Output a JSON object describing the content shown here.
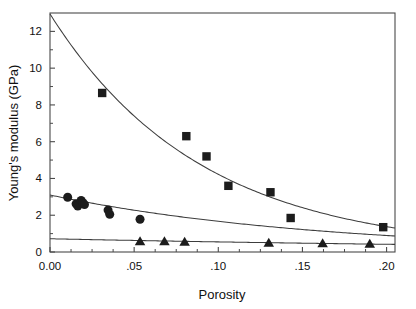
{
  "chart_data": {
    "type": "scatter",
    "title": "",
    "xlabel": "Porosity",
    "ylabel": "Young's modulus (GPa)",
    "xlim": [
      0.0,
      0.205
    ],
    "ylim": [
      0.0,
      13.0
    ],
    "xticks": [
      0.0,
      0.05,
      0.1,
      0.15,
      0.2
    ],
    "xticklabels": [
      "0.00",
      ".05",
      ".10",
      ".15",
      ".20"
    ],
    "yticks": [
      0,
      2,
      4,
      6,
      8,
      10,
      12
    ],
    "yticklabels": [
      "0",
      "2",
      "4",
      "6",
      "8",
      "10",
      "12"
    ],
    "minor_yticks": [
      1,
      3,
      5,
      7,
      9,
      11
    ],
    "grid": false,
    "legend": "none",
    "frame": "full-box",
    "series": [
      {
        "name": "series-squares",
        "marker": "square",
        "points": [
          {
            "x": 0.031,
            "y": 8.65
          },
          {
            "x": 0.081,
            "y": 6.3
          },
          {
            "x": 0.093,
            "y": 5.2
          },
          {
            "x": 0.106,
            "y": 3.6
          },
          {
            "x": 0.131,
            "y": 3.25
          },
          {
            "x": 0.143,
            "y": 1.85
          },
          {
            "x": 0.198,
            "y": 1.35
          }
        ],
        "fit": {
          "type": "exponential",
          "y0": 12.95,
          "decay_rate": 11.2,
          "x_start": 0.0,
          "x_end": 0.205
        }
      },
      {
        "name": "series-circles",
        "marker": "circle",
        "points": [
          {
            "x": 0.0105,
            "y": 2.98
          },
          {
            "x": 0.0155,
            "y": 2.62
          },
          {
            "x": 0.0165,
            "y": 2.5
          },
          {
            "x": 0.0185,
            "y": 2.8
          },
          {
            "x": 0.0195,
            "y": 2.68
          },
          {
            "x": 0.0205,
            "y": 2.58
          },
          {
            "x": 0.0345,
            "y": 2.28
          },
          {
            "x": 0.0355,
            "y": 2.05
          },
          {
            "x": 0.0535,
            "y": 1.78
          }
        ],
        "fit": {
          "type": "exponential",
          "y0": 3.1,
          "decay_rate": 6.2,
          "x_start": 0.0,
          "x_end": 0.205
        }
      },
      {
        "name": "series-triangles",
        "marker": "triangle",
        "points": [
          {
            "x": 0.0535,
            "y": 0.55
          },
          {
            "x": 0.068,
            "y": 0.55
          },
          {
            "x": 0.08,
            "y": 0.52
          },
          {
            "x": 0.13,
            "y": 0.47
          },
          {
            "x": 0.162,
            "y": 0.45
          },
          {
            "x": 0.19,
            "y": 0.42
          }
        ],
        "fit": {
          "type": "exponential",
          "y0": 0.72,
          "decay_rate": 2.7,
          "x_start": 0.0,
          "x_end": 0.205
        }
      }
    ]
  },
  "colors": {
    "marker": "#1c1c1c",
    "curve": "#3d3d3d",
    "axis": "#4a4a4a",
    "background": "#ffffff",
    "text": "#111111"
  }
}
